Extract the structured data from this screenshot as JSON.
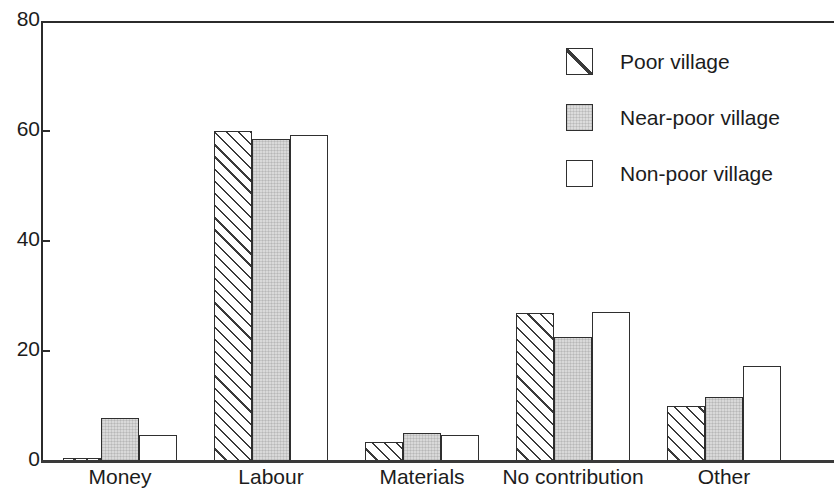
{
  "chart_data": {
    "type": "bar",
    "title": "",
    "subtitle": "",
    "xlabel": "",
    "ylabel": "",
    "categories": [
      "Money",
      "Labour",
      "Materials",
      "No contribution",
      "Other"
    ],
    "series": [
      {
        "name": "Poor village",
        "pattern": "diagonal-hatch",
        "values": [
          0.3,
          60.0,
          3.5,
          27.0,
          10.0
        ]
      },
      {
        "name": "Near-poor village",
        "pattern": "gray-fill",
        "values": [
          7.9,
          58.5,
          5.1,
          22.6,
          11.7
        ]
      },
      {
        "name": "Non-poor village",
        "pattern": "white-fill",
        "values": [
          4.8,
          59.3,
          4.7,
          27.1,
          17.3
        ]
      }
    ],
    "ylim": [
      0,
      80
    ],
    "yticks": [
      0,
      20,
      40,
      60,
      80
    ],
    "ytick_labels": [
      "0",
      "20",
      "40",
      "60",
      "80"
    ],
    "grid": false,
    "legend_position": "upper-right",
    "axis_color": "#2b2b2b",
    "bar_edge_color": "#2f2f2f",
    "gray_fill_color": "#d9d9d9",
    "hatch_color": "#3a3a3a"
  },
  "legend": {
    "items": [
      {
        "label": "Poor village",
        "style": "s-hatch",
        "icon": "hatched-square-swatch-icon"
      },
      {
        "label": "Near-poor village",
        "style": "s-gray",
        "icon": "gray-square-swatch-icon"
      },
      {
        "label": "Non-poor village",
        "style": "s-white",
        "icon": "white-square-swatch-icon"
      }
    ]
  }
}
